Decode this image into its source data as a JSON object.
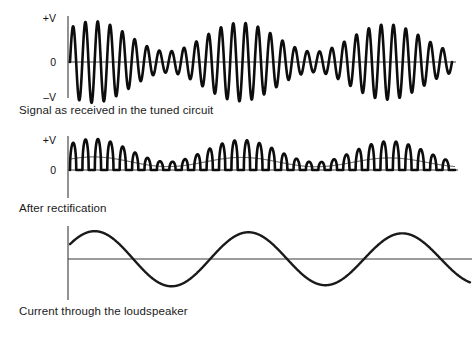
{
  "figure": {
    "title_present": false,
    "background_color": "#ffffff",
    "stroke_color": "#0d0d0d",
    "axis_color": "#3a3a3a"
  },
  "panels": [
    {
      "id": "signal",
      "caption": "Signal as received in the tuned circuit",
      "axis_labels": {
        "top": "+V",
        "middle": "0",
        "bottom": "–V"
      }
    },
    {
      "id": "rectification",
      "caption": "After rectification",
      "axis_labels": {
        "top": "+V",
        "middle": "0",
        "bottom": ""
      }
    },
    {
      "id": "loudspeaker",
      "caption": "Current through the loudspeaker",
      "axis_labels": {
        "top": "",
        "middle": "",
        "bottom": ""
      }
    }
  ],
  "chart_data": [
    {
      "type": "line",
      "id": "signal",
      "title": "Signal as received in the tuned circuit",
      "xlabel": "",
      "ylabel": "",
      "ylim": [
        -1,
        1
      ],
      "ytick_labels": [
        "+V",
        "0",
        "–V"
      ],
      "ytick_values": [
        1,
        0,
        -1
      ],
      "grid": false,
      "legend": false,
      "description": "Amplitude-modulated carrier: bipolar oscillation whose envelope rises and falls about three times across the trace.",
      "carrier_cycles": 31,
      "envelope_cycles": 2.6,
      "envelope_phase_deg": -58,
      "envelope_mean": 0.62,
      "envelope_depth": 0.36,
      "envelope_decay": 0.1,
      "x_start_px": 70,
      "x_end_px": 452,
      "baseline_px": 62,
      "amplitude_px": 42
    },
    {
      "type": "line",
      "id": "rectification",
      "title": "After rectification",
      "xlabel": "",
      "ylabel": "",
      "ylim": [
        0,
        1
      ],
      "ytick_labels": [
        "+V",
        "0"
      ],
      "ytick_values": [
        1,
        0
      ],
      "grid": false,
      "legend": false,
      "description": "Half-wave rectified carrier: only positive pulses remain, their tops tracing the same modulation envelope; a faint line links the pulse bases.",
      "carrier_cycles": 31,
      "envelope_cycles": 2.6,
      "envelope_phase_deg": -58,
      "envelope_mean": 0.62,
      "envelope_depth": 0.36,
      "envelope_decay": 0.1,
      "x_start_px": 70,
      "x_end_px": 455,
      "baseline_px": 42,
      "amplitude_px": 32
    },
    {
      "type": "line",
      "id": "loudspeaker",
      "title": "Current through the loudspeaker",
      "xlabel": "",
      "ylabel": "",
      "ylim": [
        -1,
        1
      ],
      "ytick_labels": [],
      "ytick_values": [],
      "grid": false,
      "legend": false,
      "description": "Recovered audio tone: smooth wave of about two and a half cycles, starting above zero, with the deepest trough right of centre.",
      "audio_cycles": 2.6,
      "audio_phase_deg": -58,
      "audio_amplitude": 1.0,
      "audio_decay": 0.1,
      "x_start_px": 70,
      "x_end_px": 470,
      "baseline_px": 37,
      "amplitude_px": 28
    }
  ]
}
